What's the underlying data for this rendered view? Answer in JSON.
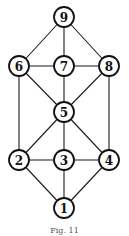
{
  "diagram": {
    "type": "graph",
    "node_radius": 10,
    "nodes": [
      {
        "id": "1",
        "label": "1",
        "x": 64,
        "y": 208
      },
      {
        "id": "2",
        "label": "2",
        "x": 19,
        "y": 160
      },
      {
        "id": "3",
        "label": "3",
        "x": 64,
        "y": 160
      },
      {
        "id": "4",
        "label": "4",
        "x": 109,
        "y": 160
      },
      {
        "id": "5",
        "label": "5",
        "x": 64,
        "y": 112
      },
      {
        "id": "6",
        "label": "6",
        "x": 19,
        "y": 66
      },
      {
        "id": "7",
        "label": "7",
        "x": 64,
        "y": 66
      },
      {
        "id": "8",
        "label": "8",
        "x": 109,
        "y": 66
      },
      {
        "id": "9",
        "label": "9",
        "x": 64,
        "y": 17
      }
    ],
    "edges": [
      [
        "9",
        "6"
      ],
      [
        "9",
        "7"
      ],
      [
        "9",
        "8"
      ],
      [
        "6",
        "7"
      ],
      [
        "7",
        "8"
      ],
      [
        "6",
        "5"
      ],
      [
        "7",
        "5"
      ],
      [
        "8",
        "5"
      ],
      [
        "6",
        "2"
      ],
      [
        "8",
        "4"
      ],
      [
        "5",
        "2"
      ],
      [
        "5",
        "3"
      ],
      [
        "5",
        "4"
      ],
      [
        "2",
        "3"
      ],
      [
        "3",
        "4"
      ],
      [
        "2",
        "1"
      ],
      [
        "3",
        "1"
      ],
      [
        "4",
        "1"
      ]
    ],
    "caption": "Fig. 11"
  }
}
